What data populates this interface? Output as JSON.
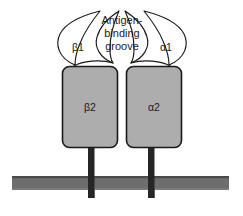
{
  "diagram": {
    "groove_label": {
      "line1": "Antigen-",
      "line2": "binding",
      "line3": "groove"
    },
    "domains": {
      "beta1": "β1",
      "alpha1": "α1",
      "beta2": "β2",
      "alpha2": "α2"
    },
    "colors": {
      "box_fill": "#adadad",
      "box_stroke": "#1a1a1a",
      "membrane_fill": "#6e6e6e",
      "membrane_edge": "#4a4a4a",
      "stem_fill": "#262626",
      "loop_stroke": "#1a1a1a",
      "background": "#ffffff",
      "text": "#1a1a1a"
    }
  }
}
